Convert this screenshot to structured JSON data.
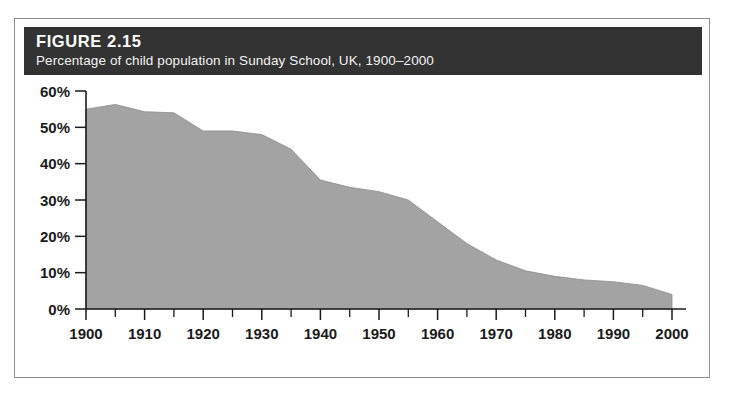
{
  "figure": {
    "number_label": "FIGURE 2.15",
    "subtitle": "Percentage of child population in Sunday School, UK, 1900–2000",
    "header_bg": "#333333",
    "header_text_color": "#ffffff",
    "frame_border_color": "#8d8d8d"
  },
  "chart_data": {
    "type": "area",
    "title": "Percentage of child population in Sunday School, UK, 1900–2000",
    "xlabel": "",
    "ylabel": "",
    "xlim": [
      1900,
      2000
    ],
    "ylim": [
      0,
      60
    ],
    "grid": false,
    "legend": "none",
    "fill_color": "#a3a3a3",
    "line_color": "#8a8a8a",
    "y_tick_labels": [
      "0%",
      "10%",
      "20%",
      "30%",
      "40%",
      "50%",
      "60%"
    ],
    "y_ticks": [
      0,
      10,
      20,
      30,
      40,
      50,
      60
    ],
    "x_tick_labels": [
      "1900",
      "1910",
      "1920",
      "1930",
      "1940",
      "1950",
      "1960",
      "1970",
      "1980",
      "1990",
      "2000"
    ],
    "x_ticks": [
      1900,
      1910,
      1920,
      1930,
      1940,
      1950,
      1960,
      1970,
      1980,
      1990,
      2000
    ],
    "x_minor_ticks": [
      1905,
      1915,
      1925,
      1935,
      1945,
      1955,
      1965,
      1975,
      1985,
      1995
    ],
    "x": [
      1900,
      1905,
      1910,
      1915,
      1920,
      1925,
      1930,
      1935,
      1940,
      1945,
      1950,
      1955,
      1960,
      1965,
      1970,
      1975,
      1980,
      1985,
      1990,
      1995,
      2000
    ],
    "values": [
      55.0,
      56.3,
      54.3,
      54.0,
      49.0,
      49.0,
      48.0,
      44.0,
      35.5,
      33.5,
      32.3,
      30.0,
      24.0,
      18.0,
      13.5,
      10.5,
      9.0,
      8.0,
      7.5,
      6.5,
      4.0
    ],
    "series": [
      {
        "name": "Percentage of child population in Sunday School",
        "values": [
          55.0,
          56.3,
          54.3,
          54.0,
          49.0,
          49.0,
          48.0,
          44.0,
          35.5,
          33.5,
          32.3,
          30.0,
          24.0,
          18.0,
          13.5,
          10.5,
          9.0,
          8.0,
          7.5,
          6.5,
          4.0
        ]
      }
    ]
  }
}
